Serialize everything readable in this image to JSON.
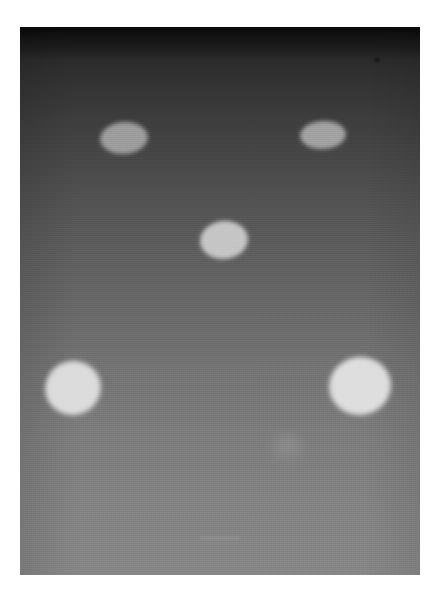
{
  "image": {
    "kind": "grayscale-photograph",
    "caption": "",
    "canvas": {
      "width": 440,
      "height": 601
    },
    "margin_color": "#ffffff",
    "plate": {
      "x": 20,
      "y": 27,
      "width": 400,
      "height": 548,
      "description": "Photographic plate with a smooth vertical tonal gradient from near-black at the top to light gray at the bottom"
    },
    "background": {
      "type": "vertical-gradient",
      "top_color": "#141414",
      "mid_color": "#626262",
      "bottom_color": "#868686",
      "grain": "fine halftone / film grain texture"
    },
    "spots": [
      {
        "id": "spot-top-left",
        "label": "top-left ellipse",
        "cx": 124,
        "cy": 138,
        "rx": 24,
        "ry": 16,
        "rotation_deg": -4,
        "fill": "#9d9d9d",
        "edge_softness_px": 2.0,
        "relative_brightness": "dim"
      },
      {
        "id": "spot-top-right",
        "label": "top-right ellipse",
        "cx": 323,
        "cy": 135,
        "rx": 23,
        "ry": 14,
        "rotation_deg": -3,
        "fill": "#a2a2a2",
        "edge_softness_px": 2.0,
        "relative_brightness": "dim"
      },
      {
        "id": "spot-center",
        "label": "center ellipse",
        "cx": 224,
        "cy": 240,
        "rx": 24,
        "ry": 19,
        "rotation_deg": -6,
        "fill": "#c6c6c6",
        "edge_softness_px": 2.2,
        "relative_brightness": "medium"
      },
      {
        "id": "spot-bottom-left",
        "label": "bottom-left ellipse",
        "cx": 73,
        "cy": 388,
        "rx": 28,
        "ry": 27,
        "rotation_deg": -22,
        "fill": "#dcdcdc",
        "edge_softness_px": 2.6,
        "relative_brightness": "bright"
      },
      {
        "id": "spot-bottom-right",
        "label": "bottom-right ellipse",
        "cx": 360,
        "cy": 386,
        "rx": 31,
        "ry": 29,
        "rotation_deg": -10,
        "fill": "#dedede",
        "edge_softness_px": 2.6,
        "relative_brightness": "bright"
      }
    ],
    "artifacts": [
      {
        "id": "smudge-low-center",
        "label": "faint diffuse smudge",
        "cx": 287,
        "cy": 446,
        "rx": 14,
        "ry": 11,
        "fill": "#9b9b9b"
      },
      {
        "id": "speck-upper-right",
        "label": "dark speck",
        "cx": 377,
        "cy": 60,
        "rx": 3,
        "ry": 2
      },
      {
        "id": "scratch-bottom-center",
        "label": "faint horizontal scratch",
        "x": 200,
        "y": 537,
        "width": 40,
        "height": 2
      }
    ],
    "spot_count": 5
  }
}
